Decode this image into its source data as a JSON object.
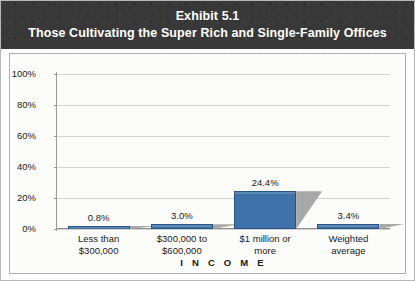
{
  "header": {
    "exhibit_label": "Exhibit 5.1",
    "subtitle": "Those Cultivating the Super Rich and Single-Family Offices"
  },
  "chart_data": {
    "type": "bar",
    "title": "Exhibit 5.1",
    "subtitle": "Those Cultivating the Super Rich and Single-Family Offices",
    "categories": [
      "Less than\n$300,000",
      "$300,000 to\n$600,000",
      "$1 million or\nmore",
      "Weighted\naverage"
    ],
    "category_lines": [
      [
        "Less than",
        "$300,000"
      ],
      [
        "$300,000 to",
        "$600,000"
      ],
      [
        "$1 million or",
        "more"
      ],
      [
        "Weighted",
        "average"
      ]
    ],
    "values": [
      0.8,
      3.0,
      24.4,
      3.4
    ],
    "value_labels": [
      "0.8%",
      "3.0%",
      "24.4%",
      "3.4%"
    ],
    "xlabel": "I N C O M E",
    "ylabel": "",
    "ylim": [
      0,
      100
    ],
    "ytick_values": [
      0,
      20,
      40,
      60,
      80,
      100
    ],
    "ytick_labels": [
      "0%",
      "20%",
      "40%",
      "60%",
      "80%",
      "100%"
    ],
    "grid": true,
    "legend": "none",
    "series_color": "#3e72a8",
    "shadow_color": "#a8a8a8"
  },
  "colors": {
    "header_background": "#383838",
    "header_text": "#ffffff",
    "bar_fill": "#3e72a8",
    "bar_border": "#2b5580",
    "bar_shadow": "#a8a8a8",
    "gridline": "#d2d2d2",
    "axis": "#9a9a9a",
    "panel_background": "#fcfcfa",
    "panel_border": "#aeaeae",
    "text": "#1a1a1a"
  }
}
